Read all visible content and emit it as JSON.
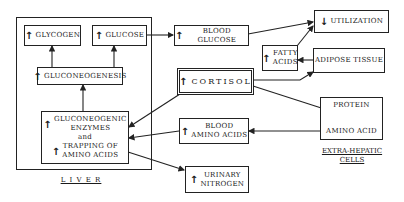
{
  "diagram": {
    "liver_label": "L I V E R",
    "extrahepatic_label_1": "EXTRA-HEPATIC",
    "extrahepatic_label_2": "CELLS",
    "up": "↑",
    "down": "↓",
    "nodes": {
      "glycogen": "GLYCOGEN",
      "glucose": "GLUCOSE",
      "gluconeogenesis": "GLUCONEOGENESIS",
      "enzymes_1": "GLUCONEOGENIC",
      "enzymes_2": "ENZYMES",
      "enzymes_3": "and",
      "enzymes_4": "TRAPPING OF",
      "enzymes_5": "AMINO ACIDS",
      "blood_glucose": "BLOOD GLUCOSE",
      "utilization": "UTILIZATION",
      "fatty_acids_1": "FATTY",
      "fatty_acids_2": "ACIDS",
      "adipose_tissue": "ADIPOSE TISSUE",
      "cortisol": "CORTISOL",
      "protein": "PROTEIN",
      "amino_acid": "AMINO ACID",
      "blood_amino_acids_1": "BLOOD",
      "blood_amino_acids_2": "AMINO ACIDS",
      "urinary_nitrogen_1": "URINARY",
      "urinary_nitrogen_2": "NITROGEN"
    }
  }
}
